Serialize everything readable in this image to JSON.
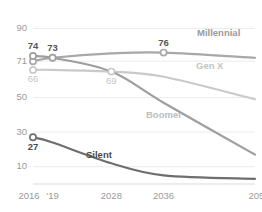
{
  "chart_data": {
    "type": "line",
    "title": "",
    "subtitle": "",
    "xlabel": "",
    "ylabel": "",
    "x": [
      2016,
      2019,
      2028,
      2036,
      2050
    ],
    "xlim": [
      2016,
      2050
    ],
    "ylim": [
      0,
      96
    ],
    "grid": true,
    "legend_position": "inline-right",
    "xticks": [
      2016,
      2019,
      2028,
      2036,
      2050
    ],
    "xtick_labels": [
      "2016",
      "'19",
      "2028",
      "2036",
      "2050"
    ],
    "yticks": [
      90,
      71,
      50,
      30,
      10
    ],
    "ytick_labels": [
      "90",
      "71",
      "50",
      "30",
      "10"
    ],
    "series": [
      {
        "name": "Millennial",
        "color": "#a8a8a8",
        "x": [
          2016,
          2019,
          2028,
          2036,
          2050
        ],
        "values": [
          71,
          73,
          75.5,
          76,
          73
        ]
      },
      {
        "name": "Gen X",
        "color": "#c9c9c9",
        "x": [
          2016,
          2019,
          2028,
          2036,
          2050
        ],
        "values": [
          66,
          66,
          65,
          62,
          49
        ]
      },
      {
        "name": "Boomer",
        "color": "#9e9e9e",
        "x": [
          2016,
          2019,
          2028,
          2036,
          2050
        ],
        "values": [
          74,
          73,
          65,
          47,
          17
        ]
      },
      {
        "name": "Silent",
        "color": "#6e6e6e",
        "x": [
          2016,
          2019,
          2028,
          2036,
          2050
        ],
        "values": [
          27,
          24,
          12,
          5,
          3
        ]
      }
    ],
    "point_labels": [
      {
        "text": "74",
        "x": 2016,
        "value": 74,
        "series": "Boomer",
        "bold": true,
        "color": "#555555"
      },
      {
        "text": "73",
        "x": 2019,
        "value": 73,
        "series": "Boomer",
        "bold": true,
        "color": "#555555"
      },
      {
        "text": "76",
        "x": 2036,
        "value": 76,
        "series": "Millennial",
        "bold": true,
        "color": "#555555"
      },
      {
        "text": "66",
        "x": 2016,
        "value": 66,
        "series": "Gen X",
        "bold": false,
        "color": "#c4c4c4"
      },
      {
        "text": "69",
        "x": 2028,
        "value": 65,
        "series": "Gen X",
        "bold": false,
        "color": "#c4c4c4"
      },
      {
        "text": "27",
        "x": 2016,
        "value": 27,
        "series": "Silent",
        "bold": true,
        "color": "#4a4a4a"
      }
    ],
    "series_labels": [
      {
        "text": "Millennial",
        "color": "#9a9a9a",
        "bold": true
      },
      {
        "text": "Gen X",
        "color": "#c4c4c4",
        "bold": true
      },
      {
        "text": "Boomer",
        "color": "#bdbdbd",
        "bold": true
      },
      {
        "text": "Silent",
        "color": "#4a4a4a",
        "bold": true
      }
    ]
  }
}
